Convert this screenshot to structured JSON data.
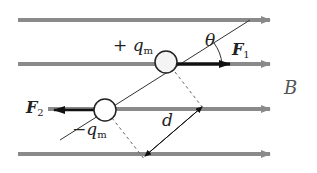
{
  "diagram": {
    "field_label": "B",
    "field_line_color": "#8a8a8a",
    "positive_charge": {
      "sign": "+",
      "symbol": "q",
      "subscript": "m"
    },
    "negative_charge": {
      "sign": "−",
      "symbol": "q",
      "subscript": "m"
    },
    "force1": {
      "symbol": "F",
      "subscript": "1"
    },
    "force2": {
      "symbol": "F",
      "subscript": "2"
    },
    "angle_label": "θ",
    "distance_label": "d"
  }
}
